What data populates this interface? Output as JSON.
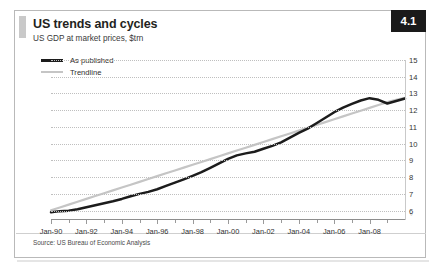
{
  "card": {
    "title": "US trends and cycles",
    "subtitle": "US GDP at market prices, $trn",
    "badge": "4.1",
    "source": "Source: US Bureau of Economic Analysis",
    "accent_color": "#1a1a1a",
    "published_color": "#1c1c1c",
    "trendline_color": "#c5c5c5",
    "grid_color": "#bfbfbf",
    "zero_marker": "0"
  },
  "legend": {
    "items": [
      {
        "label": "As published",
        "style": "thick-solid-black"
      },
      {
        "label": "Trendline",
        "style": "thin-solid-grey"
      }
    ]
  },
  "chart_data": {
    "type": "line",
    "title": "US trends and cycles",
    "subtitle": "US GDP at market prices, $trn",
    "xlabel": "",
    "ylabel": "$trn",
    "ylim": [
      5.5,
      15
    ],
    "yticks": [
      6,
      7,
      8,
      9,
      10,
      11,
      12,
      13,
      14,
      15
    ],
    "grid": true,
    "legend_position": "top-left",
    "xtick_labels": [
      "Jan-90",
      "Jan-92",
      "Jan-94",
      "Jan-96",
      "Jan-98",
      "Jan-00",
      "Jan-02",
      "Jan-04",
      "Jan-06",
      "Jan-08"
    ],
    "x": [
      1990.0,
      1990.5,
      1991.0,
      1991.5,
      1992.0,
      1992.5,
      1993.0,
      1993.5,
      1994.0,
      1994.5,
      1995.0,
      1995.5,
      1996.0,
      1996.5,
      1997.0,
      1997.5,
      1998.0,
      1998.5,
      1999.0,
      1999.5,
      2000.0,
      2000.5,
      2001.0,
      2001.5,
      2002.0,
      2002.5,
      2003.0,
      2003.5,
      2004.0,
      2004.5,
      2005.0,
      2005.5,
      2006.0,
      2006.5,
      2007.0,
      2007.5,
      2008.0,
      2008.5,
      2009.0,
      2009.5,
      2010.0
    ],
    "xlim": [
      1990.0,
      2010.0
    ],
    "series": [
      {
        "name": "As published",
        "color": "#1c1c1c",
        "width": 2.6,
        "values": [
          5.9,
          5.97,
          6.0,
          6.08,
          6.2,
          6.32,
          6.44,
          6.56,
          6.7,
          6.86,
          7.0,
          7.12,
          7.28,
          7.48,
          7.67,
          7.87,
          8.08,
          8.3,
          8.56,
          8.82,
          9.09,
          9.3,
          9.42,
          9.52,
          9.7,
          9.87,
          10.08,
          10.36,
          10.64,
          10.9,
          11.22,
          11.55,
          11.88,
          12.15,
          12.38,
          12.58,
          12.72,
          12.62,
          12.4,
          12.55,
          12.7
        ]
      },
      {
        "name": "Trendline",
        "color": "#c5c5c5",
        "width": 2.0,
        "values": [
          6.02,
          6.19,
          6.36,
          6.53,
          6.7,
          6.87,
          7.04,
          7.21,
          7.38,
          7.55,
          7.72,
          7.89,
          8.06,
          8.23,
          8.4,
          8.57,
          8.74,
          8.91,
          9.08,
          9.25,
          9.42,
          9.59,
          9.76,
          9.93,
          10.1,
          10.27,
          10.44,
          10.61,
          10.78,
          10.95,
          11.12,
          11.29,
          11.46,
          11.63,
          11.8,
          11.97,
          12.14,
          12.31,
          12.48,
          12.62,
          12.74
        ]
      }
    ]
  }
}
